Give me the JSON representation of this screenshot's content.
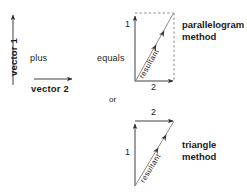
{
  "diagram": {
    "operands": {
      "vector1_label": "vector 1",
      "vector2_label": "vector 2",
      "plus_label": "plus",
      "equals_label": "equals",
      "or_label": "or"
    },
    "parallelogram": {
      "method_label_line1": "parallelogram",
      "method_label_line2": "method",
      "side_label_vertical": "1",
      "side_label_horizontal": "2",
      "resultant_label": "resultant"
    },
    "triangle": {
      "method_label_line1": "triangle",
      "method_label_line2": "method",
      "side_label_vertical": "1",
      "side_label_horizontal": "2",
      "resultant_label": "resultant"
    },
    "colors": {
      "ink": "#2b2b2b",
      "dashed": "#7d7d7d",
      "resultant": "#8a8a8a",
      "background": "#ffffff"
    }
  }
}
